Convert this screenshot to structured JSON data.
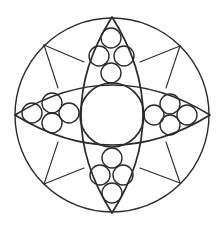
{
  "diagram": {
    "type": "geometric-mandala",
    "stroke_color": "#2a2a2a",
    "background": "#ffffff",
    "outer_circle": {
      "cx": 112,
      "cy": 115,
      "r": 97
    },
    "inner_circle": {
      "cx": 112,
      "cy": 115,
      "r": 32
    },
    "lenses": [
      {
        "name": "vertical-lens",
        "tip1": [
          112,
          17
        ],
        "tip2": [
          112,
          213
        ],
        "bulge": 31
      },
      {
        "name": "horizontal-lens",
        "tip1": [
          15,
          115
        ],
        "tip2": [
          210,
          115
        ],
        "bulge": 30
      }
    ],
    "small_circle_radius": 10,
    "clusters": [
      {
        "name": "top-cluster",
        "circles": [
          [
            111,
            38
          ],
          [
            99,
            56
          ],
          [
            124,
            56
          ],
          [
            111,
            73
          ]
        ]
      },
      {
        "name": "left-cluster",
        "circles": [
          [
            32,
            113
          ],
          [
            52,
            103
          ],
          [
            52,
            123
          ],
          [
            69,
            113
          ]
        ]
      },
      {
        "name": "right-cluster",
        "circles": [
          [
            154,
            115
          ],
          [
            170,
            104
          ],
          [
            170,
            125
          ],
          [
            187,
            115
          ]
        ]
      },
      {
        "name": "bottom-cluster",
        "circles": [
          [
            112,
            158
          ],
          [
            100,
            175
          ],
          [
            123,
            175
          ],
          [
            112,
            193
          ]
        ]
      }
    ],
    "star_points": [
      {
        "name": "nw",
        "apex": [
          44,
          45
        ],
        "ends": [
          [
            84,
            62
          ],
          [
            58,
            88
          ]
        ]
      },
      {
        "name": "ne",
        "apex": [
          180,
          46
        ],
        "ends": [
          [
            140,
            62
          ],
          [
            166,
            88
          ]
        ]
      },
      {
        "name": "sw",
        "apex": [
          44,
          184
        ],
        "ends": [
          [
            58,
            142
          ],
          [
            84,
            168
          ]
        ]
      },
      {
        "name": "se",
        "apex": [
          180,
          183
        ],
        "ends": [
          [
            166,
            142
          ],
          [
            140,
            168
          ]
        ]
      }
    ]
  }
}
